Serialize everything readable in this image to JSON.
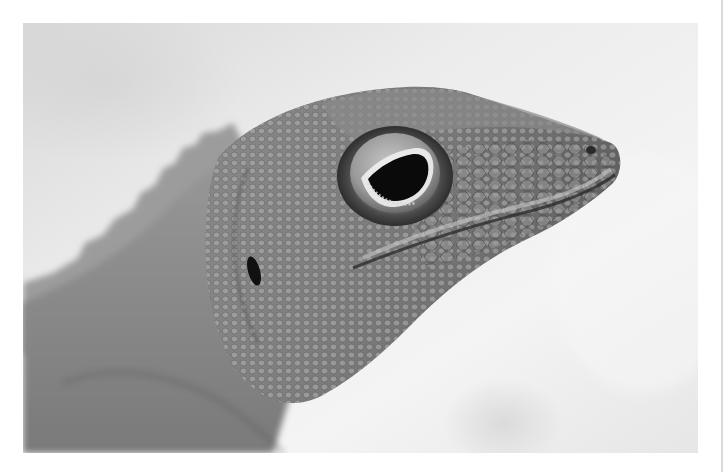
{
  "image": {
    "subject": "Close-up profile of a lizard (anole) head",
    "style": "black-and-white photograph",
    "alt": "Grayscale macro photo of an anole lizard head facing right, showing detailed scales, a large eye, a small nostril at the snout tip, an ear opening, and a spiny dorsal crest against a pale blurred background",
    "colors": {
      "border": "#ffffff",
      "background_light": "#f2f2f2",
      "background_mid": "#dcdcdc",
      "skin_mid": "#8f8f8f",
      "skin_dark": "#5e5e5e",
      "pupil": "#0a0a0a",
      "edge_line": "#d9d9d9"
    },
    "features": [
      "dorsal-crest",
      "head",
      "eye",
      "nostril",
      "ear-opening",
      "jaw-line",
      "neck-fold"
    ]
  }
}
